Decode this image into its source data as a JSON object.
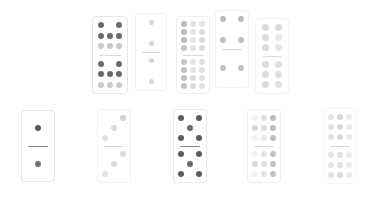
{
  "scene": {
    "title": "Domino tile layout",
    "background_color": "#ffffff",
    "rows": 2,
    "columns": 5,
    "tile_count": 10
  },
  "palette": {
    "tile_face": "#ffffff",
    "tile_border": "#e8e8e8",
    "divider": "#8e8e8e",
    "pip_dark": "#4a4a4a",
    "pip_mid": "#9a9a9a",
    "pip_light": "#cfcfcf",
    "pip_faint": "#e4e4e4"
  },
  "dominoes": [
    {
      "id": "tile-1",
      "row": "top",
      "index": 1,
      "x": 92,
      "y": 16,
      "width": 36,
      "height": 78,
      "opacity": 1.0,
      "border_color": "#e6e6e6",
      "top_half": {
        "value": 8,
        "grid": "3x3",
        "pips": [
          {
            "r": 1,
            "c": 1,
            "shade": "#6a6a6a"
          },
          {
            "r": 1,
            "c": 2,
            "shade": "#000000",
            "hidden": true
          },
          {
            "r": 1,
            "c": 3,
            "shade": "#6a6a6a"
          },
          {
            "r": 2,
            "c": 1,
            "shade": "#6a6a6a"
          },
          {
            "r": 2,
            "c": 2,
            "shade": "#6a6a6a"
          },
          {
            "r": 2,
            "c": 3,
            "shade": "#6a6a6a"
          },
          {
            "r": 3,
            "c": 1,
            "shade": "#c9c9c9"
          },
          {
            "r": 3,
            "c": 2,
            "shade": "#c9c9c9"
          },
          {
            "r": 3,
            "c": 3,
            "shade": "#c9c9c9"
          }
        ]
      },
      "bottom_half": {
        "value": 8,
        "grid": "3x3",
        "pips": [
          {
            "r": 1,
            "c": 1,
            "shade": "#6a6a6a"
          },
          {
            "r": 1,
            "c": 2,
            "shade": "#000000",
            "hidden": true
          },
          {
            "r": 1,
            "c": 3,
            "shade": "#6a6a6a"
          },
          {
            "r": 2,
            "c": 1,
            "shade": "#6a6a6a"
          },
          {
            "r": 2,
            "c": 2,
            "shade": "#6a6a6a"
          },
          {
            "r": 2,
            "c": 3,
            "shade": "#6a6a6a"
          },
          {
            "r": 3,
            "c": 1,
            "shade": "#c9c9c9"
          },
          {
            "r": 3,
            "c": 2,
            "shade": "#c9c9c9"
          },
          {
            "r": 3,
            "c": 3,
            "shade": "#c9c9c9"
          }
        ]
      }
    },
    {
      "id": "tile-2",
      "row": "top",
      "index": 2,
      "x": 135,
      "y": 13,
      "width": 32,
      "height": 78,
      "opacity": 1.0,
      "border_color": "#f0f0f0",
      "top_half": {
        "value": 2,
        "grid": "3x3",
        "pips": [
          {
            "r": 1,
            "c": 2,
            "shade": "#d6d6d6"
          },
          {
            "r": 3,
            "c": 2,
            "shade": "#d6d6d6"
          }
        ]
      },
      "bottom_half": {
        "value": 2,
        "grid": "3x3",
        "pips": [
          {
            "r": 1,
            "c": 2,
            "shade": "#d6d6d6"
          },
          {
            "r": 3,
            "c": 2,
            "shade": "#d6d6d6"
          }
        ]
      }
    },
    {
      "id": "tile-3",
      "row": "top",
      "index": 3,
      "x": 176,
      "y": 16,
      "width": 34,
      "height": 78,
      "opacity": 1.0,
      "border_color": "#efefef",
      "top_half": {
        "value": 9,
        "grid": "3x4",
        "pips": [
          {
            "r": 1,
            "c": 1,
            "shade": "#b8b8b8"
          },
          {
            "r": 1,
            "c": 2,
            "shade": "#e2e2e2"
          },
          {
            "r": 1,
            "c": 3,
            "shade": "#e2e2e2"
          },
          {
            "r": 2,
            "c": 1,
            "shade": "#b8b8b8"
          },
          {
            "r": 2,
            "c": 2,
            "shade": "#e2e2e2"
          },
          {
            "r": 2,
            "c": 3,
            "shade": "#dcdcdc"
          },
          {
            "r": 3,
            "c": 1,
            "shade": "#b8b8b8"
          },
          {
            "r": 3,
            "c": 2,
            "shade": "#e2e2e2"
          },
          {
            "r": 3,
            "c": 3,
            "shade": "#dcdcdc"
          },
          {
            "r": 4,
            "c": 1,
            "shade": "#c4c4c4"
          },
          {
            "r": 4,
            "c": 2,
            "shade": "#e2e2e2"
          },
          {
            "r": 4,
            "c": 3,
            "shade": "#dcdcdc"
          }
        ]
      },
      "bottom_half": {
        "value": 9,
        "grid": "3x4",
        "pips": [
          {
            "r": 1,
            "c": 1,
            "shade": "#c4c4c4"
          },
          {
            "r": 1,
            "c": 2,
            "shade": "#e6e6e6"
          },
          {
            "r": 1,
            "c": 3,
            "shade": "#dedede"
          },
          {
            "r": 2,
            "c": 1,
            "shade": "#c0c0c0"
          },
          {
            "r": 2,
            "c": 2,
            "shade": "#e6e6e6"
          },
          {
            "r": 2,
            "c": 3,
            "shade": "#dedede"
          },
          {
            "r": 3,
            "c": 1,
            "shade": "#c0c0c0"
          },
          {
            "r": 3,
            "c": 2,
            "shade": "#dadada"
          },
          {
            "r": 3,
            "c": 3,
            "shade": "#dedede"
          },
          {
            "r": 4,
            "c": 1,
            "shade": "#c0c0c0"
          },
          {
            "r": 4,
            "c": 2,
            "shade": "#dadada"
          },
          {
            "r": 4,
            "c": 3,
            "shade": "#dedede"
          }
        ]
      }
    },
    {
      "id": "tile-4",
      "row": "top",
      "index": 4,
      "x": 215,
      "y": 10,
      "width": 34,
      "height": 78,
      "opacity": 1.0,
      "border_color": "#f2f2f2",
      "top_half": {
        "value": 4,
        "grid": "3x3",
        "pips": [
          {
            "r": 1,
            "c": 1,
            "shade": "#bdbdbd"
          },
          {
            "r": 1,
            "c": 3,
            "shade": "#bdbdbd"
          },
          {
            "r": 3,
            "c": 1,
            "shade": "#bdbdbd"
          },
          {
            "r": 3,
            "c": 3,
            "shade": "#bdbdbd"
          }
        ]
      },
      "bottom_half": {
        "value": 2,
        "grid": "3x3",
        "pips": [
          {
            "r": 2,
            "c": 1,
            "shade": "#c2c2c2"
          },
          {
            "r": 2,
            "c": 3,
            "shade": "#c2c2c2"
          }
        ]
      }
    },
    {
      "id": "tile-5",
      "row": "top",
      "index": 5,
      "x": 255,
      "y": 18,
      "width": 34,
      "height": 76,
      "opacity": 1.0,
      "border_color": "#f3f3f3",
      "top_half": {
        "value": 6,
        "grid": "2x3",
        "pips": [
          {
            "r": 1,
            "c": 1,
            "shade": "#dcdcdc"
          },
          {
            "r": 1,
            "c": 2,
            "shade": "#dcdcdc"
          },
          {
            "r": 2,
            "c": 1,
            "shade": "#dcdcdc"
          },
          {
            "r": 2,
            "c": 2,
            "shade": "#e6e6e6"
          },
          {
            "r": 3,
            "c": 1,
            "shade": "#dcdcdc"
          },
          {
            "r": 3,
            "c": 2,
            "shade": "#e6e6e6"
          }
        ]
      },
      "bottom_half": {
        "value": 6,
        "grid": "2x3",
        "pips": [
          {
            "r": 1,
            "c": 1,
            "shade": "#dcdcdc"
          },
          {
            "r": 1,
            "c": 2,
            "shade": "#e0e0e0"
          },
          {
            "r": 2,
            "c": 1,
            "shade": "#dcdcdc"
          },
          {
            "r": 2,
            "c": 2,
            "shade": "#e0e0e0"
          },
          {
            "r": 3,
            "c": 1,
            "shade": "#dcdcdc"
          },
          {
            "r": 3,
            "c": 2,
            "shade": "#e0e0e0"
          }
        ]
      }
    },
    {
      "id": "tile-6",
      "row": "bottom",
      "index": 1,
      "x": 21,
      "y": 110,
      "width": 34,
      "height": 72,
      "opacity": 1.0,
      "border_color": "#e4e4e4",
      "top_half": {
        "value": 1,
        "grid": "3x3",
        "pips": [
          {
            "r": 2,
            "c": 2,
            "shade": "#585858"
          }
        ]
      },
      "bottom_half": {
        "value": 1,
        "grid": "3x3",
        "pips": [
          {
            "r": 2,
            "c": 2,
            "shade": "#727272"
          }
        ]
      }
    },
    {
      "id": "tile-7",
      "row": "bottom",
      "index": 2,
      "x": 97,
      "y": 109,
      "width": 34,
      "height": 74,
      "opacity": 1.0,
      "border_color": "#f1f1f1",
      "top_half": {
        "value": 3,
        "grid": "3x3",
        "pips": [
          {
            "r": 1,
            "c": 3,
            "shade": "#d2d2d2"
          },
          {
            "r": 2,
            "c": 2,
            "shade": "#dcdcdc"
          },
          {
            "r": 3,
            "c": 1,
            "shade": "#e0e0e0"
          }
        ]
      },
      "bottom_half": {
        "value": 3,
        "grid": "3x3",
        "pips": [
          {
            "r": 1,
            "c": 3,
            "shade": "#dcdcdc"
          },
          {
            "r": 2,
            "c": 2,
            "shade": "#dcdcdc"
          },
          {
            "r": 3,
            "c": 1,
            "shade": "#e4e4e4"
          }
        ]
      }
    },
    {
      "id": "tile-8",
      "row": "bottom",
      "index": 3,
      "x": 173,
      "y": 109,
      "width": 34,
      "height": 74,
      "opacity": 1.0,
      "border_color": "#e9e9e9",
      "top_half": {
        "value": 5,
        "grid": "3x3",
        "pips": [
          {
            "r": 1,
            "c": 1,
            "shade": "#5c5c5c"
          },
          {
            "r": 1,
            "c": 3,
            "shade": "#5c5c5c"
          },
          {
            "r": 2,
            "c": 2,
            "shade": "#6b6b6b"
          },
          {
            "r": 3,
            "c": 1,
            "shade": "#5c5c5c"
          },
          {
            "r": 3,
            "c": 3,
            "shade": "#5c5c5c"
          }
        ]
      },
      "bottom_half": {
        "value": 5,
        "grid": "3x3",
        "pips": [
          {
            "r": 1,
            "c": 1,
            "shade": "#5c5c5c"
          },
          {
            "r": 1,
            "c": 3,
            "shade": "#5c5c5c"
          },
          {
            "r": 2,
            "c": 2,
            "shade": "#6b6b6b"
          },
          {
            "r": 3,
            "c": 1,
            "shade": "#5c5c5c"
          },
          {
            "r": 3,
            "c": 3,
            "shade": "#5c5c5c"
          }
        ]
      }
    },
    {
      "id": "tile-9",
      "row": "bottom",
      "index": 4,
      "x": 247,
      "y": 109,
      "width": 34,
      "height": 74,
      "opacity": 1.0,
      "border_color": "#f0f0f0",
      "top_half": {
        "value": 9,
        "grid": "3x3",
        "pips": [
          {
            "r": 1,
            "c": 1,
            "shade": "#f2f2f2"
          },
          {
            "r": 1,
            "c": 2,
            "shade": "#e0e0e0"
          },
          {
            "r": 1,
            "c": 3,
            "shade": "#bcbcbc"
          },
          {
            "r": 2,
            "c": 1,
            "shade": "#d6d6d6"
          },
          {
            "r": 2,
            "c": 2,
            "shade": "#dedede"
          },
          {
            "r": 2,
            "c": 3,
            "shade": "#bcbcbc"
          },
          {
            "r": 3,
            "c": 1,
            "shade": "#f2f2f2"
          },
          {
            "r": 3,
            "c": 2,
            "shade": "#e6e6e6"
          },
          {
            "r": 3,
            "c": 3,
            "shade": "#bcbcbc"
          }
        ]
      },
      "bottom_half": {
        "value": 9,
        "grid": "3x3",
        "pips": [
          {
            "r": 1,
            "c": 1,
            "shade": "#f2f2f2"
          },
          {
            "r": 1,
            "c": 2,
            "shade": "#e4e4e4"
          },
          {
            "r": 1,
            "c": 3,
            "shade": "#c2c2c2"
          },
          {
            "r": 2,
            "c": 1,
            "shade": "#d8d8d8"
          },
          {
            "r": 2,
            "c": 2,
            "shade": "#dcdcdc"
          },
          {
            "r": 2,
            "c": 3,
            "shade": "#c2c2c2"
          },
          {
            "r": 3,
            "c": 1,
            "shade": "#f2f2f2"
          },
          {
            "r": 3,
            "c": 2,
            "shade": "#e4e4e4"
          },
          {
            "r": 3,
            "c": 3,
            "shade": "#c2c2c2"
          }
        ]
      }
    },
    {
      "id": "tile-10",
      "row": "bottom",
      "index": 5,
      "x": 323,
      "y": 108,
      "width": 34,
      "height": 76,
      "opacity": 1.0,
      "border_color": "#f4f4f4",
      "top_half": {
        "value": 9,
        "grid": "3x3",
        "pips": [
          {
            "r": 1,
            "c": 1,
            "shade": "#e2e2e2"
          },
          {
            "r": 1,
            "c": 2,
            "shade": "#d8d8d8"
          },
          {
            "r": 1,
            "c": 3,
            "shade": "#e8e8e8"
          },
          {
            "r": 2,
            "c": 1,
            "shade": "#e2e2e2"
          },
          {
            "r": 2,
            "c": 2,
            "shade": "#d8d8d8"
          },
          {
            "r": 2,
            "c": 3,
            "shade": "#e8e8e8"
          },
          {
            "r": 3,
            "c": 1,
            "shade": "#e2e2e2"
          },
          {
            "r": 3,
            "c": 2,
            "shade": "#d8d8d8"
          },
          {
            "r": 3,
            "c": 3,
            "shade": "#e8e8e8"
          }
        ]
      },
      "bottom_half": {
        "value": 9,
        "grid": "3x3",
        "pips": [
          {
            "r": 1,
            "c": 1,
            "shade": "#e2e2e2"
          },
          {
            "r": 1,
            "c": 2,
            "shade": "#dcdcdc"
          },
          {
            "r": 1,
            "c": 3,
            "shade": "#e8e8e8"
          },
          {
            "r": 2,
            "c": 1,
            "shade": "#e2e2e2"
          },
          {
            "r": 2,
            "c": 2,
            "shade": "#dcdcdc"
          },
          {
            "r": 2,
            "c": 3,
            "shade": "#e8e8e8"
          },
          {
            "r": 3,
            "c": 1,
            "shade": "#e2e2e2"
          },
          {
            "r": 3,
            "c": 2,
            "shade": "#dcdcdc"
          },
          {
            "r": 3,
            "c": 3,
            "shade": "#e8e8e8"
          }
        ]
      }
    }
  ]
}
